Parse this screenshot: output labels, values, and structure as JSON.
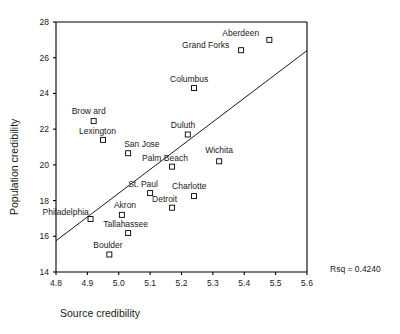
{
  "chart_data": {
    "type": "scatter",
    "title": "",
    "xlabel": "Source credibility",
    "ylabel": "Population credibility",
    "xlim": [
      4.8,
      5.6
    ],
    "ylim": [
      14,
      28
    ],
    "xticks": [
      "4.8",
      "4.9",
      "5.0",
      "5.1",
      "5.2",
      "5.3",
      "5.4",
      "5.5",
      "5.6"
    ],
    "xtick_values": [
      4.8,
      4.9,
      5.0,
      5.1,
      5.2,
      5.3,
      5.4,
      5.5,
      5.6
    ],
    "yticks": [
      "14",
      "16",
      "18",
      "20",
      "22",
      "24",
      "26",
      "28"
    ],
    "ytick_values": [
      14,
      16,
      18,
      20,
      22,
      24,
      26,
      28
    ],
    "grid": false,
    "legend": false,
    "annotation": "Rsq = 0.4240",
    "rsq": 0.424,
    "fit_line": {
      "type": "linear-regression",
      "x_start": 4.8,
      "y_start": 15.75,
      "x_end": 5.6,
      "y_end": 26.4
    },
    "points": [
      {
        "label": "Aberdeen",
        "x": 5.48,
        "y": 27.0,
        "label_dx": -47,
        "label_dy": -4
      },
      {
        "label": "Grand Forks",
        "x": 5.39,
        "y": 26.42,
        "label_dx": -59,
        "label_dy": -2
      },
      {
        "label": "Columbus",
        "x": 5.24,
        "y": 24.3,
        "label_dx": -24,
        "label_dy": -6
      },
      {
        "label": "Brow ard",
        "x": 4.92,
        "y": 22.45,
        "label_dx": -22,
        "label_dy": -7
      },
      {
        "label": "Lexington",
        "x": 4.95,
        "y": 21.4,
        "label_dx": -24,
        "label_dy": -6
      },
      {
        "label": "San Jose",
        "x": 5.03,
        "y": 20.65,
        "label_dx": -4,
        "label_dy": -6
      },
      {
        "label": "Duluth",
        "x": 5.22,
        "y": 21.7,
        "label_dx": -17,
        "label_dy": -7
      },
      {
        "label": "Palm Beach",
        "x": 5.17,
        "y": 19.9,
        "label_dx": -30,
        "label_dy": -6
      },
      {
        "label": "Wichita",
        "x": 5.32,
        "y": 20.2,
        "label_dx": -14,
        "label_dy": -8
      },
      {
        "label": "St. Paul",
        "x": 5.1,
        "y": 18.42,
        "label_dx": -22,
        "label_dy": -6
      },
      {
        "label": "Charlotte",
        "x": 5.24,
        "y": 18.25,
        "label_dx": -22,
        "label_dy": -7
      },
      {
        "label": "Detroit",
        "x": 5.17,
        "y": 17.6,
        "label_dx": -20,
        "label_dy": -6
      },
      {
        "label": "Akron",
        "x": 5.01,
        "y": 17.2,
        "label_dx": -8,
        "label_dy": -7
      },
      {
        "label": "Philadelphia",
        "x": 4.91,
        "y": 16.97,
        "label_dx": -48,
        "label_dy": -4
      },
      {
        "label": "Tallahassee",
        "x": 5.03,
        "y": 16.18,
        "label_dx": -25,
        "label_dy": -6
      },
      {
        "label": "Boulder",
        "x": 4.97,
        "y": 14.98,
        "label_dx": -16,
        "label_dy": -7
      }
    ]
  },
  "axes": {
    "x_title": "Source credibility",
    "y_title": "Population credibility"
  },
  "annotation_text": "Rsq = 0.4240"
}
